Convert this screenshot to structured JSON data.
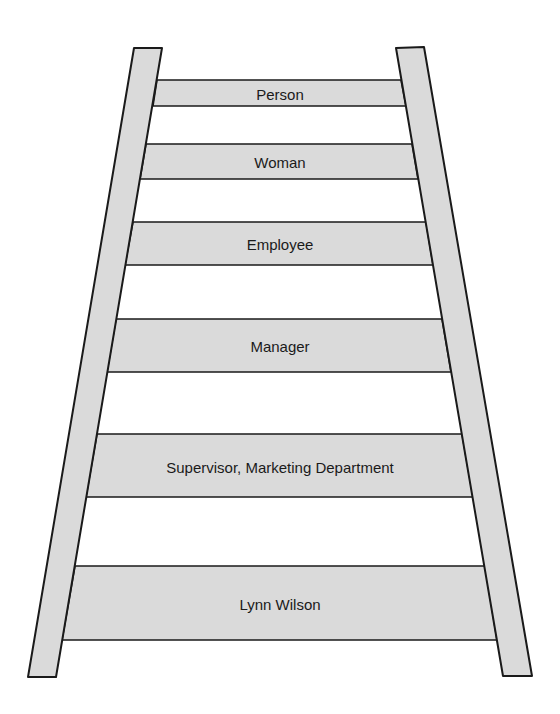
{
  "diagram": {
    "type": "ladder",
    "colors": {
      "fill": "#dadada",
      "stroke": "#1a1a1a",
      "background": "#ffffff"
    },
    "rungs": [
      {
        "label": "Person"
      },
      {
        "label": "Woman"
      },
      {
        "label": "Employee"
      },
      {
        "label": "Manager"
      },
      {
        "label": "Supervisor, Marketing Department"
      },
      {
        "label": "Lynn Wilson"
      }
    ]
  }
}
